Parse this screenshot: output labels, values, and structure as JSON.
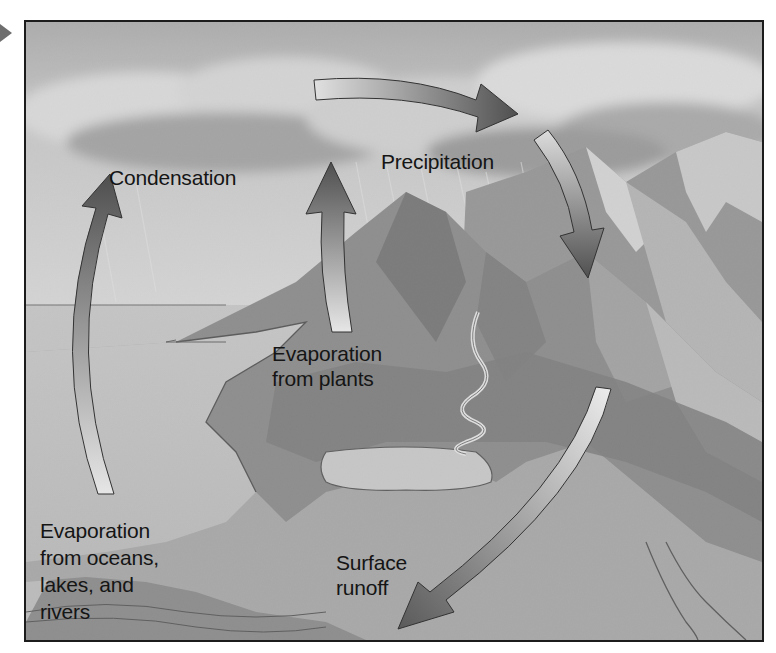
{
  "diagram": {
    "type": "process-cycle illustration",
    "palette": {
      "frame": "#1c1c1c",
      "sky": "#bdbdbd",
      "cloud": "#e6e6e6",
      "water": "#c9c9c9",
      "land": "#9a9a9a",
      "mountain_dark": "#6f6f6f",
      "mountain_light": "#d8d8d8",
      "arrow_dark": "#555555",
      "arrow_light": "#e2e2e2",
      "text": "#151515"
    },
    "pointer_icon": "triangle-right",
    "labels": {
      "condensation": "Condensation",
      "precipitation": "Precipitation",
      "evaporation_plants": "Evaporation\nfrom plants",
      "evaporation_water": "Evaporation\nfrom oceans,\nlakes, and\nrivers",
      "surface_runoff": "Surface\nrunoff"
    },
    "arrows": [
      {
        "id": "evaporation-water-arrow",
        "from": "oceans, lakes, rivers",
        "to": "clouds",
        "direction": "up"
      },
      {
        "id": "evaporation-plants-arrow",
        "from": "plants",
        "to": "clouds",
        "direction": "up"
      },
      {
        "id": "cloud-transport-arrow",
        "from": "clouds over sea",
        "to": "clouds over mountains",
        "direction": "right"
      },
      {
        "id": "precipitation-arrow",
        "from": "clouds",
        "to": "mountains",
        "direction": "down"
      },
      {
        "id": "surface-runoff-arrow",
        "from": "mountains",
        "to": "lake/ocean",
        "direction": "down-left"
      }
    ]
  }
}
